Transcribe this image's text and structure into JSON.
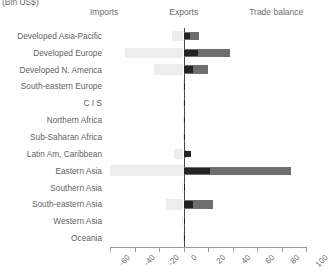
{
  "chart_data": {
    "type": "bar",
    "orientation": "horizontal",
    "title": "(Bln US$)",
    "xlabel": "",
    "ylabel": "",
    "xlim": [
      -60,
      100
    ],
    "grid": false,
    "legend_position": "top",
    "xticks": [
      -60,
      -40,
      -20,
      0,
      20,
      40,
      60,
      80,
      100
    ],
    "xticklabels": [
      "-60",
      "-40",
      "-20",
      "0",
      "20",
      "40",
      "60",
      "80",
      "100"
    ],
    "categories": [
      "Developed Asia-Pacific",
      "Developed Europe",
      "Developed N. America",
      "South-eastern Europe",
      "C I S",
      "Northern Africa",
      "Sub-Saharan Africa",
      "Latin Am, Caribbean",
      "Eastern Asia",
      "Southern Asia",
      "South-eastern Asia",
      "Western Asia",
      "Oceania"
    ],
    "series": [
      {
        "name": "Imports",
        "color": "#ededed",
        "values": [
          -9,
          -48,
          -24,
          -0.5,
          -0.5,
          -0.5,
          -0.5,
          -8,
          -60,
          -1,
          -14,
          -1,
          -0.3
        ]
      },
      {
        "name": "Exports",
        "color": "#6e6e6e",
        "values": [
          13,
          38,
          20,
          0.5,
          0.5,
          0.5,
          0.5,
          2,
          88,
          1.5,
          24,
          1.5,
          0.3
        ]
      },
      {
        "name": "Trade balance",
        "color": "#232323",
        "values": [
          5,
          12,
          8,
          0.4,
          0.4,
          0.4,
          0.4,
          6,
          22,
          1.2,
          8,
          1.2,
          0.3
        ]
      }
    ]
  },
  "legend": {
    "entries": [
      {
        "label": "Imports",
        "key": "imports"
      },
      {
        "label": "Exports",
        "key": "exports"
      },
      {
        "label": "Trade balance",
        "key": "balance"
      }
    ]
  }
}
